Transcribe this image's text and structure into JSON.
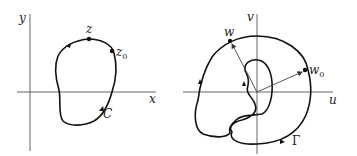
{
  "left_panel": {
    "axes": {
      "horizontal_label": "x",
      "vertical_label": "y"
    },
    "curve_label": "C",
    "points": [
      {
        "label": "z",
        "subscript": ""
      },
      {
        "label": "z",
        "subscript": "0"
      }
    ]
  },
  "right_panel": {
    "axes": {
      "horizontal_label": "u",
      "vertical_label": "v"
    },
    "curve_label": "Γ",
    "points": [
      {
        "label": "w",
        "subscript": ""
      },
      {
        "label": "w",
        "subscript": "0"
      }
    ]
  },
  "colors": {
    "stroke": "#111111",
    "axis": "#555555",
    "background": "#ffffff"
  }
}
